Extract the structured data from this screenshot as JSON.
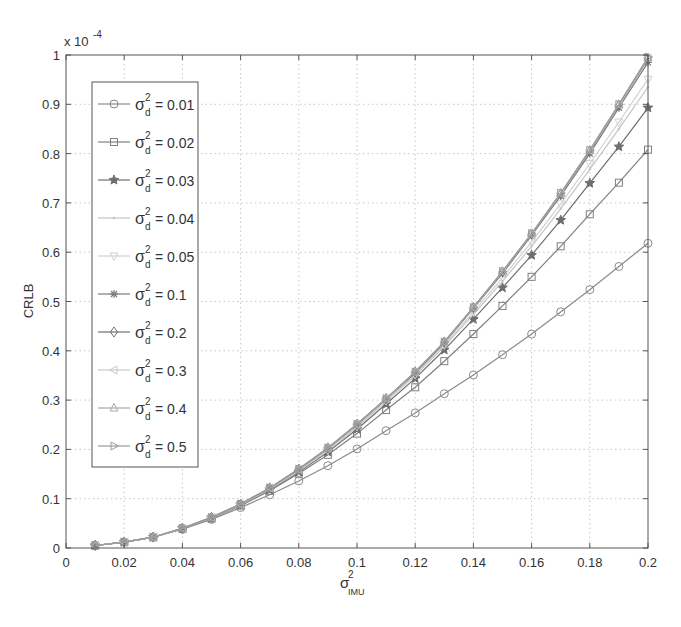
{
  "chart_data": {
    "type": "line",
    "title": "",
    "xlabel": "σ²_IMU",
    "xlabel_parts": {
      "base": "σ",
      "sup": "2",
      "sub": "IMU"
    },
    "ylabel": "CRLB",
    "y_exponent_label": "x 10",
    "y_exponent_power": "-4",
    "xlim": [
      0,
      0.2
    ],
    "ylim": [
      0,
      1
    ],
    "x_ticks": [
      0,
      0.02,
      0.04,
      0.06,
      0.08,
      0.1,
      0.12,
      0.14,
      0.16,
      0.18,
      0.2
    ],
    "x_tick_labels": [
      "0",
      "0.02",
      "0.04",
      "0.06",
      "0.08",
      "0.1",
      "0.12",
      "0.14",
      "0.16",
      "0.18",
      "0.2"
    ],
    "y_ticks": [
      0,
      0.1,
      0.2,
      0.3,
      0.4,
      0.5,
      0.6,
      0.7,
      0.8,
      0.9,
      1
    ],
    "y_tick_labels": [
      "0",
      "0.1",
      "0.2",
      "0.3",
      "0.4",
      "0.5",
      "0.6",
      "0.7",
      "0.8",
      "0.9",
      "1"
    ],
    "grid": true,
    "legend_position": "upper left",
    "x": [
      0.01,
      0.02,
      0.03,
      0.04,
      0.05,
      0.06,
      0.07,
      0.08,
      0.09,
      0.1,
      0.11,
      0.12,
      0.13,
      0.14,
      0.15,
      0.16,
      0.17,
      0.18,
      0.19,
      0.2
    ],
    "series": [
      {
        "name": "σ²_d = 0.01",
        "label_value": "0.01",
        "marker": "circle",
        "color": "#8a8a8a",
        "values": [
          0.005,
          0.012,
          0.022,
          0.038,
          0.058,
          0.082,
          0.108,
          0.136,
          0.167,
          0.201,
          0.238,
          0.274,
          0.313,
          0.351,
          0.392,
          0.434,
          0.479,
          0.524,
          0.571,
          0.618
        ]
      },
      {
        "name": "σ²_d = 0.02",
        "label_value": "0.02",
        "marker": "square",
        "color": "#808080",
        "values": [
          0.005,
          0.012,
          0.022,
          0.039,
          0.06,
          0.086,
          0.116,
          0.151,
          0.189,
          0.232,
          0.28,
          0.326,
          0.379,
          0.434,
          0.491,
          0.55,
          0.612,
          0.677,
          0.741,
          0.808
        ]
      },
      {
        "name": "σ²_d = 0.03",
        "label_value": "0.03",
        "marker": "star",
        "color": "#6e6e6e",
        "values": [
          0.005,
          0.012,
          0.022,
          0.04,
          0.061,
          0.088,
          0.118,
          0.154,
          0.195,
          0.241,
          0.292,
          0.344,
          0.402,
          0.464,
          0.528,
          0.594,
          0.665,
          0.74,
          0.814,
          0.893
        ]
      },
      {
        "name": "σ²_d = 0.04",
        "label_value": "0.04",
        "marker": "point",
        "color": "#c4c4c4",
        "values": [
          0.005,
          0.012,
          0.022,
          0.04,
          0.061,
          0.088,
          0.119,
          0.156,
          0.198,
          0.245,
          0.297,
          0.35,
          0.409,
          0.474,
          0.541,
          0.612,
          0.688,
          0.768,
          0.85,
          0.935
        ]
      },
      {
        "name": "σ²_d = 0.05",
        "label_value": "0.05",
        "marker": "triangle-down",
        "color": "#d0d0d0",
        "values": [
          0.005,
          0.012,
          0.022,
          0.04,
          0.061,
          0.088,
          0.12,
          0.157,
          0.199,
          0.247,
          0.299,
          0.352,
          0.412,
          0.479,
          0.548,
          0.621,
          0.698,
          0.78,
          0.864,
          0.951
        ]
      },
      {
        "name": "σ²_d = 0.1",
        "label_value": "0.1",
        "marker": "asterisk",
        "color": "#7a7a7a",
        "values": [
          0.005,
          0.012,
          0.022,
          0.04,
          0.062,
          0.089,
          0.121,
          0.159,
          0.202,
          0.25,
          0.302,
          0.355,
          0.416,
          0.486,
          0.557,
          0.634,
          0.714,
          0.8,
          0.893,
          0.985
        ]
      },
      {
        "name": "σ²_d = 0.2",
        "label_value": "0.2",
        "marker": "diamond",
        "color": "#707070",
        "values": [
          0.005,
          0.012,
          0.022,
          0.04,
          0.062,
          0.089,
          0.122,
          0.16,
          0.203,
          0.251,
          0.303,
          0.357,
          0.418,
          0.488,
          0.56,
          0.637,
          0.718,
          0.805,
          0.898,
          0.992
        ]
      },
      {
        "name": "σ²_d = 0.3",
        "label_value": "0.3",
        "marker": "triangle-left",
        "color": "#c8c8c8",
        "values": [
          0.005,
          0.012,
          0.022,
          0.04,
          0.062,
          0.089,
          0.122,
          0.16,
          0.203,
          0.251,
          0.303,
          0.357,
          0.418,
          0.488,
          0.56,
          0.637,
          0.719,
          0.806,
          0.899,
          0.994
        ]
      },
      {
        "name": "σ²_d = 0.4",
        "label_value": "0.4",
        "marker": "triangle-up",
        "color": "#a8a8a8",
        "values": [
          0.005,
          0.012,
          0.022,
          0.04,
          0.062,
          0.089,
          0.122,
          0.16,
          0.203,
          0.251,
          0.303,
          0.357,
          0.418,
          0.488,
          0.561,
          0.638,
          0.72,
          0.807,
          0.9,
          0.995
        ]
      },
      {
        "name": "σ²_d = 0.5",
        "label_value": "0.5",
        "marker": "triangle-right",
        "color": "#9a9a9a",
        "values": [
          0.005,
          0.012,
          0.022,
          0.04,
          0.062,
          0.089,
          0.122,
          0.16,
          0.203,
          0.251,
          0.303,
          0.357,
          0.418,
          0.488,
          0.561,
          0.638,
          0.72,
          0.807,
          0.9,
          0.996
        ]
      }
    ]
  },
  "legend": {
    "symbol_base": "σ",
    "symbol_sup": "2",
    "symbol_sub": "d",
    "equals": "="
  }
}
